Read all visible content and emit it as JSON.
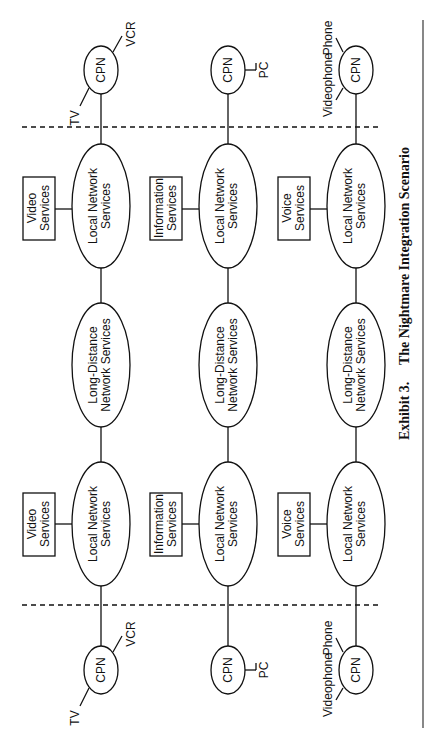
{
  "caption": {
    "label": "Exhibit 3.",
    "title": "The Nightmare Integration Scenario"
  },
  "rows": [
    {
      "service": {
        "line1": "Video",
        "line2": "Services"
      },
      "cpn_devices": [
        "TV",
        "VCR"
      ]
    },
    {
      "service": {
        "line1": "Information",
        "line2": "Services"
      },
      "cpn_devices": [
        "PC"
      ]
    },
    {
      "service": {
        "line1": "Voice",
        "line2": "Services"
      },
      "cpn_devices": [
        "Videophone",
        "Phone"
      ]
    }
  ],
  "labels": {
    "cpn": "CPN",
    "local_line1": "Local Network",
    "local_line2": "Services",
    "ld_line1": "Long-Distance",
    "ld_line2": "Network Services"
  },
  "colors": {
    "ink": "#111111",
    "background": "#ffffff"
  }
}
